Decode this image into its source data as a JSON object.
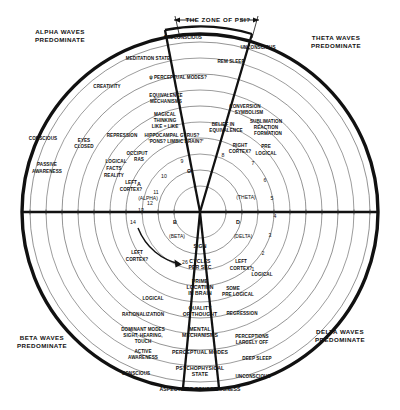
{
  "diagram": {
    "title": "ASPECTS OF CONSCIOUSNESS",
    "zone_label": "THE ZONE OF PSI?",
    "center": {
      "cx": 200,
      "cy": 212
    },
    "quadrant_labels": [
      {
        "id": "alpha",
        "line1": "ALPHA WAVES",
        "line2": "PREDOMINATE",
        "x": 60,
        "y": 34
      },
      {
        "id": "theta",
        "line1": "THETA WAVES",
        "line2": "PREDOMINATE",
        "x": 336,
        "y": 40
      },
      {
        "id": "beta",
        "line1": "BETA WAVES",
        "line2": "PREDOMINATE",
        "x": 42,
        "y": 340
      },
      {
        "id": "delta",
        "line1": "DELTA WAVES",
        "line2": "PREDOMINATE",
        "x": 340,
        "y": 334
      }
    ],
    "greek_letters": [
      {
        "symbol": "A",
        "name": "(ALPHA)",
        "sx": 139,
        "sy": 186,
        "nx": 148,
        "ny": 200
      },
      {
        "symbol": "Θ",
        "name": "(THETA)",
        "sx": 189,
        "sy": 173,
        "nx": 246,
        "ny": 199
      },
      {
        "symbol": "B",
        "name": "(BETA)",
        "sx": 175,
        "sy": 224,
        "nx": 177,
        "ny": 238
      },
      {
        "symbol": "D",
        "name": "(DELTA)",
        "sx": 238,
        "sy": 224,
        "nx": 243,
        "ny": 238
      }
    ],
    "cycle_numbers": [
      {
        "label": "1",
        "x": 253,
        "y": 271
      },
      {
        "label": "2",
        "x": 263,
        "y": 255
      },
      {
        "label": "3",
        "x": 270,
        "y": 237
      },
      {
        "label": "4",
        "x": 275,
        "y": 218
      },
      {
        "label": "5",
        "x": 272,
        "y": 200
      },
      {
        "label": "6",
        "x": 265,
        "y": 182
      },
      {
        "label": "7",
        "x": 253,
        "y": 165
      },
      {
        "label": "8",
        "x": 223,
        "y": 157
      },
      {
        "label": "9",
        "x": 182,
        "y": 163
      },
      {
        "label": "10",
        "x": 164,
        "y": 178
      },
      {
        "label": "11",
        "x": 156,
        "y": 194
      },
      {
        "label": "12",
        "x": 150,
        "y": 205
      },
      {
        "label": "13",
        "x": 141,
        "y": 212
      },
      {
        "label": "14",
        "x": 133,
        "y": 224
      },
      {
        "label": "26",
        "x": 185,
        "y": 264
      }
    ],
    "center_column": [
      {
        "label": "SIGN",
        "x": 200,
        "y": 248
      },
      {
        "label": "CYCLES",
        "x": 200,
        "y": 263
      },
      {
        "label": "PER SEC",
        "x": 200,
        "y": 269
      },
      {
        "label": "PRIME",
        "x": 200,
        "y": 283
      },
      {
        "label": "LOCATION",
        "x": 200,
        "y": 289
      },
      {
        "label": "IN BRAIN",
        "x": 200,
        "y": 295
      },
      {
        "label": "QUALITY",
        "x": 200,
        "y": 310
      },
      {
        "label": "OF THOUGHT",
        "x": 200,
        "y": 316
      },
      {
        "label": "MENTAL",
        "x": 200,
        "y": 331
      },
      {
        "label": "MECHANISMS",
        "x": 200,
        "y": 337
      },
      {
        "label": "PERCEPTUAL MODES",
        "x": 200,
        "y": 354
      },
      {
        "label": "PSYCHOPHYSICAL",
        "x": 200,
        "y": 370
      },
      {
        "label": "STATE",
        "x": 200,
        "y": 376
      },
      {
        "label": "ASPECTS OF CONSCIOUSNESS",
        "x": 200,
        "y": 391
      }
    ],
    "alpha_sector": [
      {
        "label": "PRECONSCIOUS",
        "x": 183,
        "y": 39
      },
      {
        "label": "MEDITATION STATE",
        "x": 148,
        "y": 60
      },
      {
        "label": "ψ PERCEPTUAL MODES?",
        "x": 178,
        "y": 79
      },
      {
        "label": "EQUIVALENCE",
        "x": 166,
        "y": 97
      },
      {
        "label": "MECHANISMS",
        "x": 166,
        "y": 103
      },
      {
        "label": "MAGICAL",
        "x": 165,
        "y": 116
      },
      {
        "label": "THINKING",
        "x": 165,
        "y": 122
      },
      {
        "label": "LIKE = LIKE",
        "x": 165,
        "y": 128
      },
      {
        "label": "HIPPOCAMPAL GYRUS?",
        "x": 172,
        "y": 137
      },
      {
        "label": "'PONS? LIMBIC BRAIN?'",
        "x": 176,
        "y": 143
      },
      {
        "label": "OCCIPUT",
        "x": 137,
        "y": 155
      },
      {
        "label": "RAS",
        "x": 139,
        "y": 161
      },
      {
        "label": "CREATIVITY",
        "x": 107,
        "y": 88
      },
      {
        "label": "REPRESSION",
        "x": 122,
        "y": 137
      },
      {
        "label": "EYES",
        "x": 84,
        "y": 142
      },
      {
        "label": "CLOSED",
        "x": 84,
        "y": 148
      },
      {
        "label": "LOGICAL",
        "x": 116,
        "y": 163
      },
      {
        "label": "FACTS",
        "x": 114,
        "y": 170
      },
      {
        "label": "REALITY",
        "x": 114,
        "y": 177
      },
      {
        "label": "LEFT",
        "x": 131,
        "y": 184
      },
      {
        "label": "CORTEX?",
        "x": 131,
        "y": 191
      },
      {
        "label": "CONSCIOUS",
        "x": 43,
        "y": 140
      },
      {
        "label": "PASSIVE",
        "x": 47,
        "y": 166
      },
      {
        "label": "AWARENESS",
        "x": 47,
        "y": 173
      }
    ],
    "theta_sector": [
      {
        "label": "UNCONSCIOUS",
        "x": 258,
        "y": 49
      },
      {
        "label": "REM SLEEP",
        "x": 231,
        "y": 63
      },
      {
        "label": "CONVERSION",
        "x": 245,
        "y": 108
      },
      {
        "label": "SYMBOLISM",
        "x": 249,
        "y": 114
      },
      {
        "label": "BELIEF IN",
        "x": 223,
        "y": 126
      },
      {
        "label": "EQUIVALENCE",
        "x": 226,
        "y": 132
      },
      {
        "label": "SUBLIMATION",
        "x": 266,
        "y": 123
      },
      {
        "label": "REACTION",
        "x": 266,
        "y": 129
      },
      {
        "label": "FORMATION",
        "x": 268,
        "y": 135
      },
      {
        "label": "RIGHT",
        "x": 240,
        "y": 147
      },
      {
        "label": "CORTEX?",
        "x": 240,
        "y": 153
      },
      {
        "label": "PRE",
        "x": 266,
        "y": 148
      },
      {
        "label": "LOGICAL",
        "x": 266,
        "y": 155
      }
    ],
    "delta_sector": [
      {
        "label": "LEFT",
        "x": 241,
        "y": 263
      },
      {
        "label": "CORTEX?",
        "x": 241,
        "y": 270
      },
      {
        "label": "LOGICAL",
        "x": 262,
        "y": 276
      },
      {
        "label": "SOME",
        "x": 233,
        "y": 290
      },
      {
        "label": "PRE LOGICAL",
        "x": 238,
        "y": 296
      },
      {
        "label": "REGRESSION",
        "x": 242,
        "y": 315
      },
      {
        "label": "PERCEPTIONS",
        "x": 252,
        "y": 338
      },
      {
        "label": "LARGELY OFF",
        "x": 252,
        "y": 344
      },
      {
        "label": "DEEP SLEEP",
        "x": 257,
        "y": 360
      },
      {
        "label": "UNCONSCIOUS",
        "x": 253,
        "y": 378
      }
    ],
    "beta_sector": [
      {
        "label": "LEFT",
        "x": 137,
        "y": 254
      },
      {
        "label": "CORTEX?",
        "x": 137,
        "y": 261
      },
      {
        "label": "LOGICAL",
        "x": 153,
        "y": 300
      },
      {
        "label": "RATIONALIZATION",
        "x": 143,
        "y": 316
      },
      {
        "label": "DOMINANT MODES",
        "x": 143,
        "y": 331
      },
      {
        "label": "SIGHT, HEARING,",
        "x": 143,
        "y": 337
      },
      {
        "label": "TOUCH",
        "x": 143,
        "y": 343
      },
      {
        "label": "ACTIVE",
        "x": 143,
        "y": 353
      },
      {
        "label": "AWARENESS",
        "x": 143,
        "y": 359
      },
      {
        "label": "CONSCIOUS",
        "x": 136,
        "y": 375
      }
    ]
  }
}
